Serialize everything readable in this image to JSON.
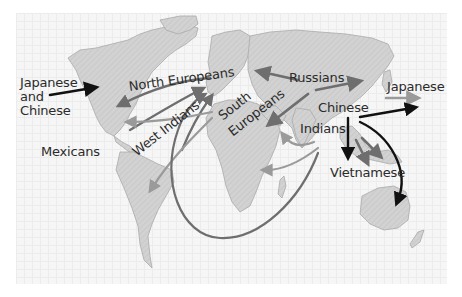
{
  "map": {
    "title": "World migration flows",
    "colors": {
      "land": "#d4d4d4",
      "land_stroke": "#a9a9a9",
      "arrow_dark": "#111111",
      "arrow_mid": "#6e6e6e",
      "arrow_light": "#9a9a9a",
      "background_grid": "#ececec"
    },
    "labels": {
      "japanese_and_chinese": "Japanese\nand\nChinese",
      "north_europeans": "North Europeans",
      "south_europeans_1": "South",
      "south_europeans_2": "Europeans",
      "west_indians": "West Indians",
      "mexicans": "Mexicans",
      "russians": "Russians",
      "japanese": "Japanese",
      "chinese": "Chinese",
      "indians": "Indians",
      "vietnamese": "Vietnamese"
    },
    "flows": [
      {
        "group": "Japanese and Chinese",
        "from": "East Asia",
        "to": "North America",
        "shade": "dark"
      },
      {
        "group": "North Europeans",
        "from": "Northern Europe",
        "to": "North America",
        "shade": "mid"
      },
      {
        "group": "West Indians",
        "from": "Caribbean",
        "to": "Europe",
        "shade": "mid"
      },
      {
        "group": "South Europeans",
        "from": "Southern Europe",
        "to": "South America",
        "shade": "light"
      },
      {
        "group": "South Europeans",
        "from": "Southern Europe",
        "to": "Caribbean",
        "shade": "light"
      },
      {
        "group": "Russians",
        "from": "Russia",
        "to": "Eastern Europe",
        "shade": "mid"
      },
      {
        "group": "Russians",
        "from": "Russia",
        "to": "Siberia",
        "shade": "mid"
      },
      {
        "group": "Russians",
        "from": "Russia",
        "to": "Middle East",
        "shade": "mid"
      },
      {
        "group": "Japanese",
        "from": "Japan",
        "to": "Pacific",
        "shade": "light"
      },
      {
        "group": "Chinese",
        "from": "China",
        "to": "Pacific",
        "shade": "dark"
      },
      {
        "group": "Chinese",
        "from": "China",
        "to": "Southeast Asia",
        "shade": "dark"
      },
      {
        "group": "Chinese",
        "from": "China",
        "to": "Australia",
        "shade": "dark"
      },
      {
        "group": "Vietnamese",
        "from": "Indochina",
        "to": "Southeast Asia",
        "shade": "mid"
      },
      {
        "group": "Indians",
        "from": "India",
        "to": "Arabian Peninsula",
        "shade": "light"
      },
      {
        "group": "Indians",
        "from": "India",
        "to": "East Africa",
        "shade": "light"
      },
      {
        "group": "Indians",
        "from": "India",
        "to": "Caribbean",
        "shade": "light"
      },
      {
        "group": "Indians",
        "from": "India",
        "to": "Southern Africa / Caribbean",
        "shade": "mid"
      }
    ]
  }
}
